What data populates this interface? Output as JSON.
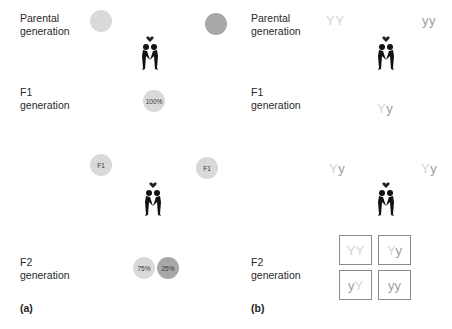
{
  "panel_a": {
    "letter": "(a)",
    "rows": {
      "parental": {
        "line1": "Parental",
        "line2": "generation"
      },
      "f1": {
        "line1": "F1",
        "line2": "generation"
      },
      "f2": {
        "line1": "F2",
        "line2": "generation"
      }
    },
    "parental_circles": [
      {
        "shade": "light",
        "color": "#d9d9d9",
        "label": ""
      },
      {
        "shade": "dark",
        "color": "#a8a8a8",
        "label": ""
      }
    ],
    "f1_circle": {
      "label": "100%",
      "color": "#d9d9d9"
    },
    "f1_cross_circles": [
      {
        "label": "F1",
        "color": "#d9d9d9"
      },
      {
        "label": "F1",
        "color": "#d9d9d9"
      }
    ],
    "f2_circles": [
      {
        "label": "75%",
        "color": "#d9d9d9"
      },
      {
        "label": "25%",
        "color": "#a8a8a8"
      }
    ]
  },
  "panel_b": {
    "letter": "(b)",
    "rows": {
      "parental": {
        "line1": "Parental",
        "line2": "generation"
      },
      "f1": {
        "line1": "F1",
        "line2": "generation"
      },
      "f2": {
        "line1": "F2",
        "line2": "generation"
      }
    },
    "parental_genotypes": [
      {
        "a1": "Y",
        "a2": "Y"
      },
      {
        "a1": "y",
        "a2": "y"
      }
    ],
    "f1_genotype": {
      "a1": "Y",
      "a2": "y"
    },
    "f1_cross_genotypes": [
      {
        "a1": "Y",
        "a2": "y"
      },
      {
        "a1": "Y",
        "a2": "y"
      }
    ],
    "punnett": [
      {
        "a1": "Y",
        "a2": "Y"
      },
      {
        "a1": "Y",
        "a2": "y"
      },
      {
        "a1": "y",
        "a2": "Y"
      },
      {
        "a1": "y",
        "a2": "y"
      }
    ]
  },
  "icons": {
    "cross": "couple-with-heart-icon"
  }
}
